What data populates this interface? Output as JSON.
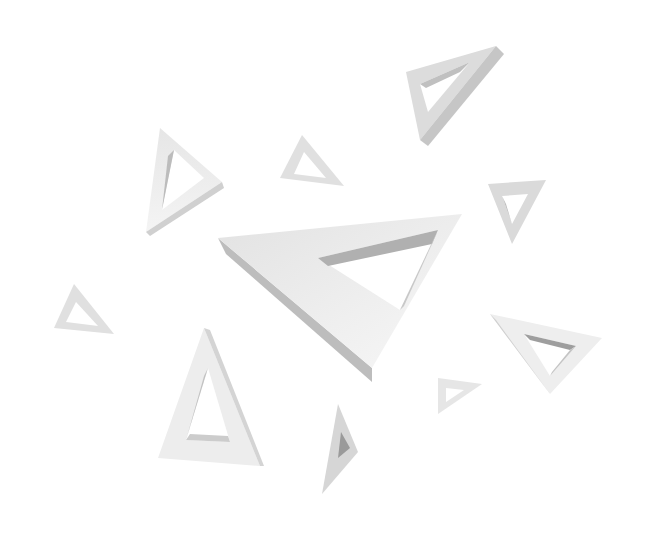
{
  "image": {
    "description": "Floating 3D white impossible-style triangle frames on white background",
    "background": "#ffffff",
    "colors": {
      "face_light": "#ececec",
      "face_mid": "#d6d6d6",
      "face_dark": "#b8b8b8",
      "shadow": "#9e9e9e"
    }
  },
  "shapes": [
    {
      "name": "large-center-triangle",
      "outer": "218,238 462,214 372,368",
      "inner": "318,258 438,230 400,310",
      "depth": "218,238 226,252 372,380 372,368"
    },
    {
      "name": "top-right-triangle",
      "outer": "402,72 498,44 418,142",
      "inner": "420,84 470,62 428,112",
      "depth": "498,44 506,52 424,148 418,142"
    },
    {
      "name": "left-upper-triangle",
      "outer": "160,128 222,180 146,232",
      "inner": "172,150 202,178 160,210",
      "depth": "222,180 224,186 150,236 146,232"
    },
    {
      "name": "small-upper-triangle",
      "outer": "302,135 344,186 280,178",
      "inner": "304,152 326,178 294,174",
      "depth": ""
    },
    {
      "name": "right-small-triangle",
      "outer": "488,184 546,180 512,244",
      "inner": "500,194 530,192 512,226",
      "depth": ""
    },
    {
      "name": "left-small-triangle",
      "outer": "74,284 114,334 54,328",
      "inner": "76,302 98,328 66,322",
      "depth": ""
    },
    {
      "name": "right-large-triangle",
      "outer": "490,314 602,338 550,394",
      "inner": "522,336 576,348 548,378",
      "depth": ""
    },
    {
      "name": "bottom-left-tall-triangle",
      "outer": "204,328 260,466 158,458",
      "inner": "206,366 230,442 184,440",
      "depth": "204,328 210,330 264,466 260,466"
    },
    {
      "name": "bottom-small-triangle",
      "outer": "338,404 356,452 322,494",
      "inner": "340,432 348,448 336,460",
      "depth": ""
    },
    {
      "name": "bottom-right-small-triangle",
      "outer": "438,378 482,384 438,414",
      "inner": "446,386 464,388 446,402",
      "depth": ""
    }
  ]
}
